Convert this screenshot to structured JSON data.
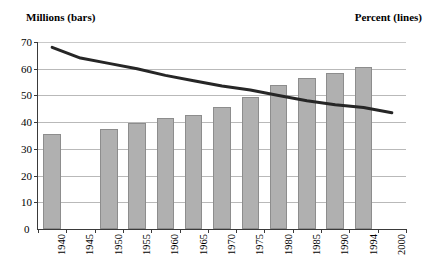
{
  "header": {
    "left_label": "Millions (bars)",
    "right_label": "Percent (lines)"
  },
  "chart_data": {
    "type": "bar",
    "title": "",
    "subtitle": "",
    "xlabel": "",
    "ylabel": "Millions (bars)",
    "y2label": "Percent (lines)",
    "grid": true,
    "legend": "none",
    "ylim": [
      0,
      70
    ],
    "yticks": [
      0,
      10,
      20,
      30,
      40,
      50,
      60,
      70
    ],
    "categories": [
      "1940",
      "1945",
      "1950",
      "1955",
      "1960",
      "1965",
      "1970",
      "1975",
      "1980",
      "1985",
      "1990",
      "1994",
      "2000"
    ],
    "series": [
      {
        "name": "Millions (bars)",
        "type": "bar",
        "values": [
          35.5,
          null,
          37.5,
          39.5,
          41.5,
          42.5,
          45.5,
          49.5,
          54,
          56.5,
          58.5,
          60.5,
          null
        ]
      },
      {
        "name": "Percent (lines)",
        "type": "line",
        "values": [
          68,
          64,
          62,
          60,
          57.5,
          55.5,
          53.5,
          52,
          50,
          48,
          46.5,
          45.5,
          43.5
        ]
      }
    ]
  },
  "colors": {
    "bar_fill": "#b0b0b0",
    "bar_stroke": "#8d8d8d",
    "line": "#262626",
    "grid": "#b9b9b9",
    "axis": "#3a3a3a"
  }
}
